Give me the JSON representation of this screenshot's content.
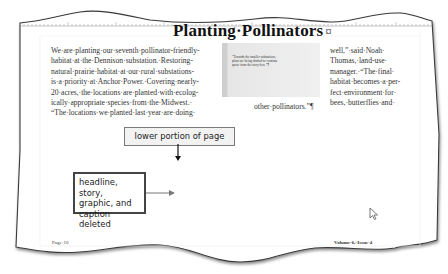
{
  "document": {
    "headline": "Planting·Pollinators",
    "headline_end_mark": "¤",
    "column1_lines": [
      "We·are·planting·our·seventh·pollinator-friendly-",
      "habitat·at·the·Dennison·substation.·Restoring-",
      "natural·prairie·habitat·at·our·rural·substations-",
      "is·a·priority·at·Anchor·Power.·Covering·nearly-",
      "20·acres,·the·locations·are·planted·with·ecolog-",
      "ically·appropriate·species·from·the·Midwest.·",
      "“The·locations·we·planted·last·year·are·doing·"
    ],
    "column2_tail": "other·pollinators.”¶",
    "column3_lines": [
      "well,”·said·Noah·",
      "Thomas,·land-use·",
      "manager.·“The·final·",
      "habitat·becomes·a·per-",
      "fect·environment·for·",
      "bees,·butterflies·and·"
    ],
    "pull_quote_lines": [
      "“Towards·the·smaller·substations,·",
      "plans·are·being·drafted·to·continue",
      "quote·from·the·story·here.”¶"
    ],
    "footer_left": "Page·10",
    "footer_right": "Volume·6,·Issue·4"
  },
  "callouts": {
    "top": "lower portion of page",
    "bottom_lines": [
      "headline, story,",
      "graphic, and",
      "caption deleted"
    ]
  },
  "colors": {
    "page_edge": "#333333",
    "callout_fill": "#f2f2f2",
    "arrow": "#111111"
  }
}
